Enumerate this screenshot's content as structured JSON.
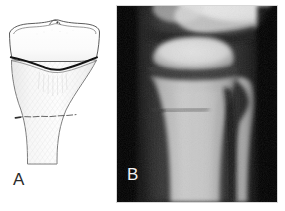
{
  "figure": {
    "width": 285,
    "height": 211,
    "background_color": "#ffffff",
    "panel_count": 2
  },
  "panel_a": {
    "label": "A",
    "label_color": "#2b2b2b",
    "type": "line-drawing",
    "background_color": "#ffffff",
    "outline_color": "#3a3a3a",
    "shading_color": "#f0f0f0",
    "structures": [
      {
        "name": "tibial-plateau",
        "description": "articular surface of proximal tibia"
      },
      {
        "name": "intercondylar-eminence",
        "description": "central tibial spine bump on plateau"
      },
      {
        "name": "tibial-epiphysis",
        "description": "epiphysis above growth plate"
      },
      {
        "name": "physis",
        "description": "wavy dark growth plate line",
        "color": "#111111"
      },
      {
        "name": "metaphysis",
        "description": "flared bone below physis"
      },
      {
        "name": "fracture-line",
        "description": "transverse metaphyseal fracture",
        "color": "#555555"
      },
      {
        "name": "tibial-diaphysis",
        "description": "bone shaft tapering distally"
      }
    ]
  },
  "panel_b": {
    "label": "B",
    "label_color": "#f2f2f2",
    "type": "radiograph",
    "view": "anteroposterior knee",
    "background_color": "#0a0a0a",
    "bone_color": "#a8a8a8",
    "bright_bone_color": "#d2d2d2",
    "structures": [
      {
        "name": "distal-femur",
        "description": "bright bone at top of image"
      },
      {
        "name": "joint-space",
        "description": "dark lucent gap between femur and tibia"
      },
      {
        "name": "tibial-epiphysis",
        "description": "bright ovoid bone below joint space"
      },
      {
        "name": "physis",
        "description": "lucent transverse growth plate line"
      },
      {
        "name": "tibial-metaphysis",
        "description": "flared bone below physis"
      },
      {
        "name": "fracture-line",
        "description": "lucent transverse metaphyseal fracture"
      },
      {
        "name": "tibial-diaphysis",
        "description": "bone shaft extending inferiorly"
      },
      {
        "name": "proximal-fibula",
        "description": "narrow bone lateral to tibia"
      },
      {
        "name": "soft-tissue",
        "description": "dark grey tissue shadow at margins"
      }
    ]
  }
}
